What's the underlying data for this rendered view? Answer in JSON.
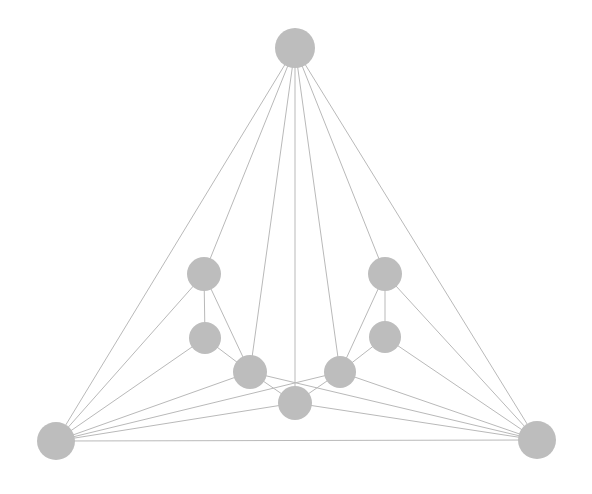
{
  "figure": {
    "kind": "node-link-graph",
    "title": "",
    "background_color": "#ffffff",
    "width": 592,
    "height": 494
  },
  "style": {
    "node_fill": "#bdbdbd",
    "node_stroke": "none",
    "edge_color": "#b9b9b9",
    "edge_width": 1
  },
  "chart_data": {
    "type": "scatter",
    "title": "",
    "xlabel": "",
    "ylabel": "",
    "grid": false,
    "legend": null,
    "xlim": [
      0,
      592
    ],
    "ylim": [
      0,
      494
    ],
    "node_count": 9,
    "edge_count": 20,
    "nodes": [
      {
        "id": "apex-top",
        "label": "",
        "x": 295,
        "y": 48,
        "r": 20,
        "degree": 7
      },
      {
        "id": "left-upper",
        "label": "",
        "x": 204,
        "y": 274,
        "r": 17,
        "degree": 4
      },
      {
        "id": "left-middle",
        "label": "",
        "x": 205,
        "y": 338,
        "r": 16,
        "degree": 3
      },
      {
        "id": "left-lower",
        "label": "",
        "x": 250,
        "y": 372,
        "r": 17,
        "degree": 6
      },
      {
        "id": "center-lower",
        "label": "",
        "x": 295,
        "y": 403,
        "r": 17,
        "degree": 5
      },
      {
        "id": "right-lower",
        "label": "",
        "x": 340,
        "y": 372,
        "r": 16,
        "degree": 6
      },
      {
        "id": "right-middle",
        "label": "",
        "x": 385,
        "y": 337,
        "r": 16,
        "degree": 3
      },
      {
        "id": "right-upper",
        "label": "",
        "x": 385,
        "y": 274,
        "r": 17,
        "degree": 4
      },
      {
        "id": "base-left",
        "label": "",
        "x": 56,
        "y": 441,
        "r": 19,
        "degree": 6
      },
      {
        "id": "base-right",
        "label": "",
        "x": 537,
        "y": 440,
        "r": 19,
        "degree": 6
      }
    ],
    "edges": [
      {
        "source": "apex-top",
        "target": "base-left"
      },
      {
        "source": "apex-top",
        "target": "left-upper"
      },
      {
        "source": "apex-top",
        "target": "left-lower"
      },
      {
        "source": "apex-top",
        "target": "center-lower"
      },
      {
        "source": "apex-top",
        "target": "right-lower"
      },
      {
        "source": "apex-top",
        "target": "right-upper"
      },
      {
        "source": "apex-top",
        "target": "base-right"
      },
      {
        "source": "left-upper",
        "target": "left-middle"
      },
      {
        "source": "left-upper",
        "target": "left-lower"
      },
      {
        "source": "left-upper",
        "target": "base-left"
      },
      {
        "source": "left-middle",
        "target": "left-lower"
      },
      {
        "source": "left-middle",
        "target": "base-left"
      },
      {
        "source": "left-lower",
        "target": "center-lower"
      },
      {
        "source": "left-lower",
        "target": "base-left"
      },
      {
        "source": "left-lower",
        "target": "base-right"
      },
      {
        "source": "right-upper",
        "target": "right-middle"
      },
      {
        "source": "right-upper",
        "target": "right-lower"
      },
      {
        "source": "right-upper",
        "target": "base-right"
      },
      {
        "source": "right-middle",
        "target": "right-lower"
      },
      {
        "source": "right-middle",
        "target": "base-right"
      },
      {
        "source": "right-lower",
        "target": "center-lower"
      },
      {
        "source": "right-lower",
        "target": "base-right"
      },
      {
        "source": "right-lower",
        "target": "base-left"
      },
      {
        "source": "center-lower",
        "target": "base-left"
      },
      {
        "source": "center-lower",
        "target": "base-right"
      },
      {
        "source": "base-left",
        "target": "base-right"
      }
    ]
  }
}
